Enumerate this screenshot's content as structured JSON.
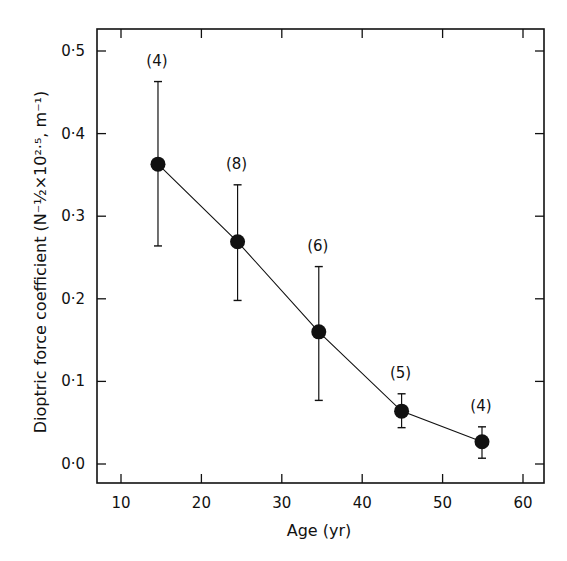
{
  "chart_data": {
    "type": "line",
    "title": "",
    "xlabel": "Age (yr)",
    "ylabel": "Dioptric force coefficient (N⁻½×10²·⁵, m⁻¹)",
    "xlim": [
      7.5,
      62.5
    ],
    "ylim": [
      -0.024,
      0.527
    ],
    "x_ticks": [
      10,
      20,
      30,
      40,
      50,
      60
    ],
    "x_tick_labels": [
      "10",
      "20",
      "30",
      "40",
      "50",
      "60"
    ],
    "y_ticks": [
      0.0,
      0.1,
      0.2,
      0.3,
      0.4,
      0.5
    ],
    "y_tick_labels": [
      "0·0",
      "0·1",
      "0·2",
      "0·3",
      "0·4",
      "0·5"
    ],
    "grid": false,
    "legend": null,
    "series": [
      {
        "name": "Dioptric force coefficient",
        "marker": "filled-circle",
        "x": [
          14.6,
          24.5,
          34.6,
          44.9,
          54.9
        ],
        "values": [
          0.363,
          0.269,
          0.16,
          0.064,
          0.027
        ],
        "error_low": [
          0.264,
          0.198,
          0.077,
          0.044,
          0.007
        ],
        "error_high": [
          0.463,
          0.338,
          0.239,
          0.085,
          0.045
        ],
        "annotations": [
          "(4)",
          "(8)",
          "(6)",
          "(5)",
          "(4)"
        ]
      }
    ]
  },
  "style": {
    "ink": "#111111",
    "background": "#ffffff"
  }
}
